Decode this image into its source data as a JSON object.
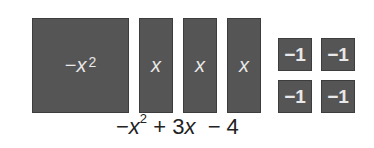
{
  "tiles": {
    "x_squared": {
      "label_prefix": "−",
      "var": "x",
      "exp": "2"
    },
    "x_tiles": [
      {
        "label": "x"
      },
      {
        "label": "x"
      },
      {
        "label": "x"
      }
    ],
    "unit_tiles": [
      {
        "label": "−1"
      },
      {
        "label": "−1"
      },
      {
        "label": "−1"
      },
      {
        "label": "−1"
      }
    ]
  },
  "expression": {
    "part1_sign": "−",
    "part1_var": "x",
    "part1_exp": "2",
    "part2": " + 3",
    "part2_var": "x",
    "part3": "  − 4"
  },
  "colors": {
    "tile": "#555555",
    "tile_text": "#e8e8e8"
  }
}
